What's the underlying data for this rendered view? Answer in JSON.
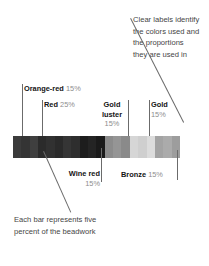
{
  "annotations": {
    "top_right": {
      "lines": [
        "Clear labels identify",
        "the colors used and",
        "the proportions",
        "they are used in"
      ]
    },
    "bottom_left": {
      "lines": [
        "Each bar represents five",
        "percent of the beadwork"
      ]
    }
  },
  "labels": {
    "orange_red": {
      "name": "Orange-red",
      "percent": "15%"
    },
    "red": {
      "name": "Red",
      "percent": "25%"
    },
    "gold_luster": {
      "name_line1": "Gold",
      "name_line2": "luster",
      "percent": "15%"
    },
    "gold": {
      "name": "Gold",
      "percent": "15%"
    },
    "wine_red": {
      "name": "Wine red",
      "percent": "15%"
    },
    "bronze": {
      "name": "Bronze",
      "percent": "15%"
    }
  },
  "chart_data": {
    "type": "bar",
    "note": "Each bar represents five percent of the beadwork",
    "categories": [
      "Orange-red",
      "Red",
      "Wine red",
      "Gold luster",
      "Gold",
      "Bronze"
    ],
    "values": [
      15,
      25,
      15,
      15,
      15,
      15
    ],
    "unit": "percent",
    "bar_count": 20,
    "bar_value": 5,
    "segments": [
      {
        "name": "Orange-red",
        "percent": 15,
        "bars": 3,
        "color": "#3a3a3a"
      },
      {
        "name": "Red",
        "percent": 25,
        "bars": 5,
        "color": "#2d2d2d"
      },
      {
        "name": "Wine red",
        "percent": 15,
        "bars": 3,
        "color": "#1f1f1f"
      },
      {
        "name": "Gold luster",
        "percent": 15,
        "bars": 3,
        "color": "#8f8f8f"
      },
      {
        "name": "Gold",
        "percent": 15,
        "bars": 3,
        "color": "#d2d2d2"
      },
      {
        "name": "Bronze",
        "percent": 15,
        "bars": 3,
        "color": "#a6a6a6"
      }
    ],
    "bar_colors": [
      "#3b3b3b",
      "#343434",
      "#3f3f3f",
      "#2b2b2b",
      "#313131",
      "#2a2a2a",
      "#353535",
      "#2e2e2e",
      "#1d1d1d",
      "#242424",
      "#1a1a1a",
      "#8b8b8b",
      "#959595",
      "#8a8a8a",
      "#d6d6d6",
      "#cfcfcf",
      "#dcdcdc",
      "#a3a3a3",
      "#ababab",
      "#9d9d9d"
    ]
  }
}
